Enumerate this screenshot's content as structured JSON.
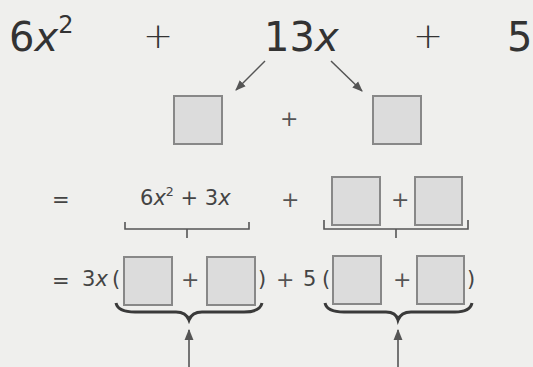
{
  "expression": {
    "term1_coef": "6",
    "term1_var": "x",
    "term1_exp": "2",
    "op1": "+",
    "term2_coef": "13",
    "term2_var": "x",
    "op2": "+",
    "term3": "5"
  },
  "split_row": {
    "op": "+",
    "boxes": [
      "",
      ""
    ]
  },
  "grouping_row": {
    "equals": "=",
    "group1_coef": "6",
    "group1_var": "x",
    "group1_exp": "2",
    "group1_op": "+",
    "group1_term2": "3",
    "group1_term2_var": "x",
    "middle_op": "+",
    "group2_op": "+",
    "group2_boxes": [
      "",
      ""
    ]
  },
  "factored_row": {
    "equals": "=",
    "factor1_coef": "3",
    "factor1_var": "x",
    "open_paren": "(",
    "inner_op1": "+",
    "close_paren": ")",
    "middle_op": "+",
    "factor2": "5",
    "open_paren2": "(",
    "inner_op2": "+",
    "close_paren2": ")"
  },
  "colors": {
    "background": "#efefed",
    "box_fill": "#dcdcdc",
    "box_border": "#888888",
    "text": "#333333",
    "lines": "#555555"
  }
}
